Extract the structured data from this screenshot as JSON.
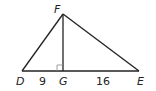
{
  "diagram": {
    "type": "right-triangle-altitude",
    "colors": {
      "stroke": "#222222",
      "right_angle_marker": "#888888",
      "background": "#ffffff"
    },
    "points": {
      "D": {
        "label": "D",
        "x": 22,
        "y": 71
      },
      "G": {
        "label": "G",
        "x": 63,
        "y": 71
      },
      "E": {
        "label": "E",
        "x": 139,
        "y": 71
      },
      "F": {
        "label": "F",
        "x": 63,
        "y": 14
      }
    },
    "segments": [
      {
        "from": "D",
        "to": "F"
      },
      {
        "from": "F",
        "to": "E"
      },
      {
        "from": "D",
        "to": "E"
      },
      {
        "from": "F",
        "to": "G"
      }
    ],
    "right_angle_at": "G",
    "measurements": {
      "DG": "9",
      "GE": "16"
    }
  }
}
